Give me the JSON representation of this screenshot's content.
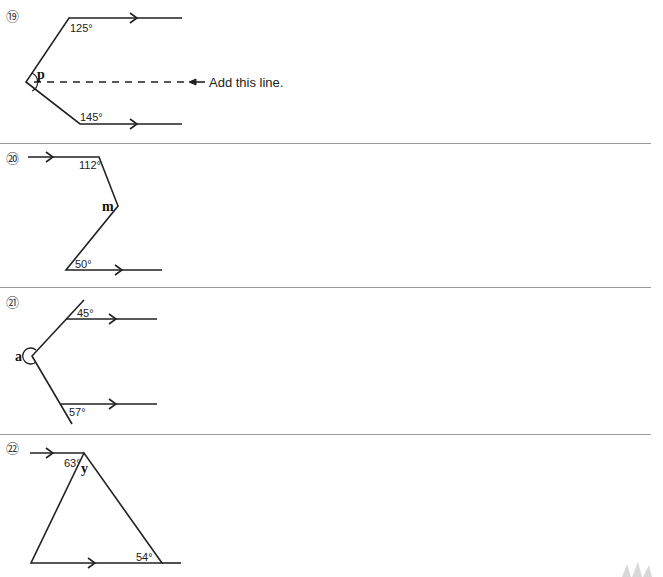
{
  "worksheet": {
    "problems": [
      {
        "number": "⑲",
        "angles": [
          "125°",
          "145°"
        ],
        "unknown": "p",
        "annotation": "Add this line."
      },
      {
        "number": "⑳",
        "angles": [
          "112°",
          "50°"
        ],
        "unknown": "m"
      },
      {
        "number": "㉑",
        "angles": [
          "45°",
          "57°"
        ],
        "unknown": "a"
      },
      {
        "number": "㉒",
        "angles": [
          "63°",
          "54°"
        ],
        "unknown": "y"
      }
    ]
  }
}
